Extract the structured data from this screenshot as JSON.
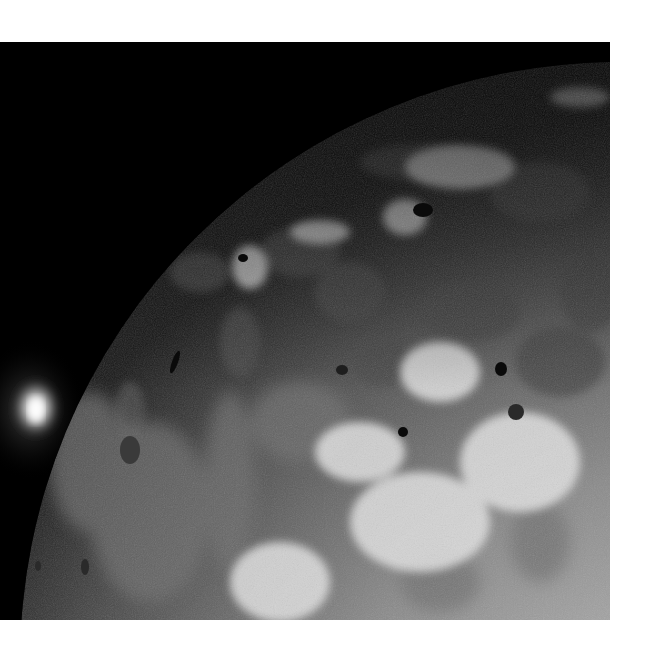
{
  "image": {
    "subject": "Io moon surface with volcanic plume on limb",
    "style": "grayscale",
    "colors": {
      "space": "#000000",
      "page_background": "#ffffff",
      "surface_dark": "#3a3a3a",
      "surface_mid": "#8c8c8c",
      "surface_light": "#d8d8d8",
      "plume": "#f4f4f4"
    }
  }
}
